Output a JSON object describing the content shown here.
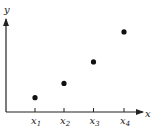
{
  "chart_data": {
    "type": "scatter",
    "title": "",
    "xlabel": "x",
    "ylabel": "y",
    "categories": [
      "x1",
      "x2",
      "x3",
      "x4"
    ],
    "tick_labels": [
      {
        "base": "x",
        "sub": "1"
      },
      {
        "base": "x",
        "sub": "2"
      },
      {
        "base": "x",
        "sub": "3"
      },
      {
        "base": "x",
        "sub": "4"
      }
    ],
    "x": [
      1,
      2,
      3,
      4
    ],
    "values": [
      1,
      2,
      3.5,
      5.6
    ],
    "grid": false,
    "legend": null,
    "colors": {
      "axis": "#222222",
      "point": "#111111"
    }
  }
}
